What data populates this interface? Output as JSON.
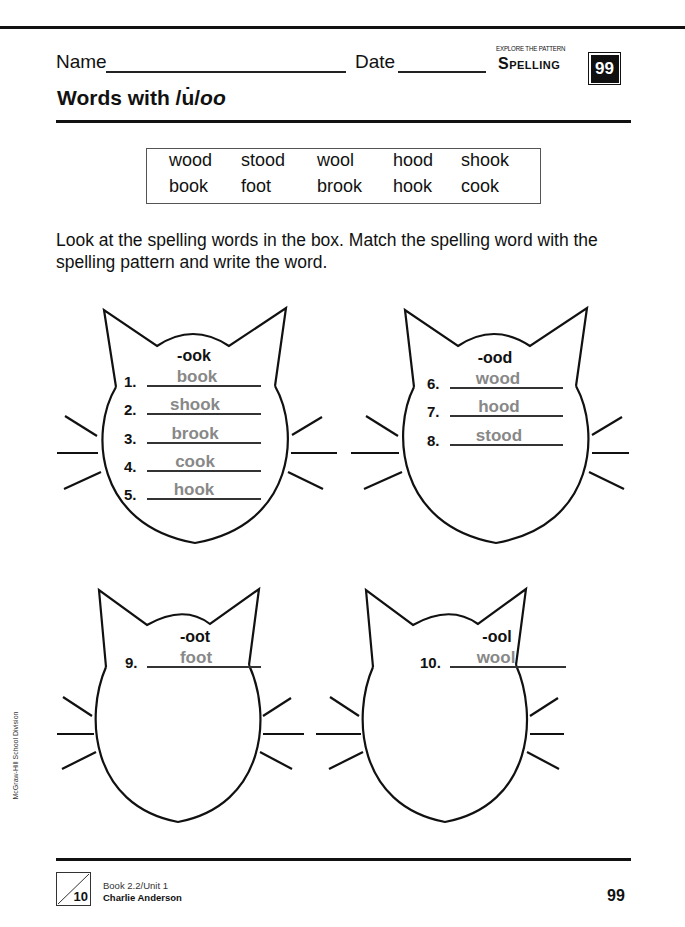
{
  "header": {
    "name_label": "Name",
    "date_label": "Date",
    "section_kicker": "EXPLORE THE PATTERN",
    "subject": "Spelling",
    "badge_number": "99"
  },
  "title": {
    "prefix": "Words with /u̇/",
    "italic": "oo"
  },
  "word_box": {
    "rows": [
      [
        "wood",
        "stood",
        "wool",
        "hood",
        "shook"
      ],
      [
        "book",
        "foot",
        "brook",
        "hook",
        "cook"
      ]
    ]
  },
  "instructions": "Look at the spelling words in the box. Match the spelling word with the spelling pattern and write the word.",
  "cats": [
    {
      "pattern": "-ook",
      "items": [
        {
          "number": "1.",
          "answer": "book"
        },
        {
          "number": "2.",
          "answer": "shook"
        },
        {
          "number": "3.",
          "answer": "brook"
        },
        {
          "number": "4.",
          "answer": "cook"
        },
        {
          "number": "5.",
          "answer": "hook"
        }
      ]
    },
    {
      "pattern": "-ood",
      "items": [
        {
          "number": "6.",
          "answer": "wood"
        },
        {
          "number": "7.",
          "answer": "hood"
        },
        {
          "number": "8.",
          "answer": "stood"
        }
      ]
    },
    {
      "pattern": "-oot",
      "items": [
        {
          "number": "9.",
          "answer": "foot"
        }
      ]
    },
    {
      "pattern": "-ool",
      "items": [
        {
          "number": "10.",
          "answer": "wool"
        }
      ]
    }
  ],
  "side_credit": "McGraw-Hill School Division",
  "footer": {
    "corner_number": "10",
    "book_unit": "Book 2.2/Unit 1",
    "student_name": "Charlie Anderson",
    "page_number": "99"
  },
  "colors": {
    "ink": "#111111",
    "answer_gray": "#888888"
  }
}
